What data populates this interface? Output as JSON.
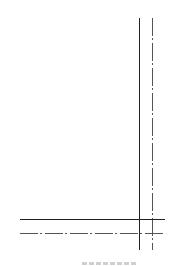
{
  "diagram": {
    "type": "line-style-diagram",
    "lines": [
      {
        "id": "vertical-solid",
        "style": "solid",
        "orientation": "vertical",
        "x": 139,
        "y1": 18,
        "y2": 250,
        "color": "#222222"
      },
      {
        "id": "vertical-dash-dot",
        "style": "dash-dot",
        "orientation": "vertical",
        "x": 152,
        "y1": 18,
        "y2": 250,
        "color": "#555555"
      },
      {
        "id": "horizontal-solid",
        "style": "solid",
        "orientation": "horizontal",
        "y": 219,
        "x1": 20,
        "x2": 165,
        "color": "#222222"
      },
      {
        "id": "horizontal-dash-dot",
        "style": "dash-dot",
        "orientation": "horizontal",
        "y": 233,
        "x1": 20,
        "x2": 165,
        "color": "#555555"
      }
    ],
    "caption": {
      "visible": true,
      "legible": false,
      "text": ""
    }
  }
}
